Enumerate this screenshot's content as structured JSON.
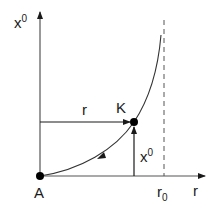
{
  "diagram": {
    "axes": {
      "vertical_label": "x",
      "vertical_label_sup": "0",
      "horizontal_label": "r"
    },
    "points": {
      "origin_label": "A",
      "point_label": "K"
    },
    "arrows": {
      "horizontal_segment_label": "r",
      "vertical_segment_label": "x",
      "vertical_segment_label_sup": "0"
    },
    "asymptote": {
      "label": "r",
      "label_sub": "0"
    },
    "colors": {
      "stroke": "#1a1a1a",
      "axis": "#555555",
      "background": "#ffffff"
    }
  }
}
